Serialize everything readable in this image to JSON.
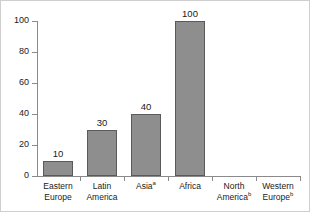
{
  "chart_data": {
    "type": "bar",
    "title": "",
    "subtitle": "",
    "xlabel": "",
    "ylabel": "",
    "ylim": [
      0,
      100
    ],
    "yticks": [
      0,
      20,
      40,
      60,
      80,
      100
    ],
    "grid": false,
    "legend": null,
    "bar_color": "#8e8e8e",
    "bar_edge_color": "#5a5a5a",
    "axis_color": "#8a8a8a",
    "text_color": "#1a1a1a",
    "categories": [
      "Eastern Europe",
      "Latin America",
      "Asia",
      "Africa",
      "North America",
      "Western Europe"
    ],
    "values": [
      10,
      30,
      40,
      100,
      0,
      0
    ],
    "data_labels": [
      "10",
      "30",
      "40",
      "100",
      "",
      ""
    ],
    "footnote_markers": [
      "",
      "",
      "a",
      "",
      "b",
      "b"
    ]
  },
  "axis": {
    "y_tick_labels": [
      "0",
      "20",
      "40",
      "60",
      "80",
      "100"
    ]
  },
  "categories_display": [
    {
      "line1": "Eastern",
      "line2": "Europe",
      "sup1": "",
      "sup2": ""
    },
    {
      "line1": "Latin",
      "line2": "America",
      "sup1": "",
      "sup2": ""
    },
    {
      "line1": "Asia",
      "line2": "",
      "sup1": "a",
      "sup2": ""
    },
    {
      "line1": "Africa",
      "line2": "",
      "sup1": "",
      "sup2": ""
    },
    {
      "line1": "North",
      "line2": "America",
      "sup1": "",
      "sup2": "b"
    },
    {
      "line1": "Western",
      "line2": "Europe",
      "sup1": "",
      "sup2": "b"
    }
  ],
  "bars": [
    {
      "label": "10"
    },
    {
      "label": "30"
    },
    {
      "label": "40"
    },
    {
      "label": "100"
    },
    {
      "label": ""
    },
    {
      "label": ""
    }
  ]
}
